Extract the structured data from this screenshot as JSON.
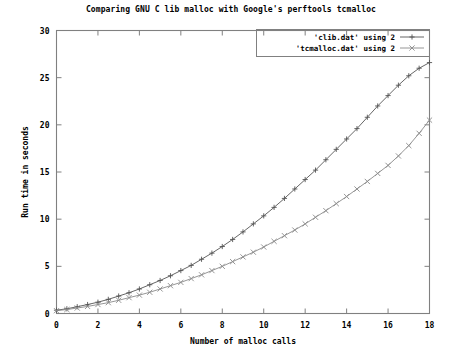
{
  "chart_data": {
    "type": "line",
    "title": "Comparing GNU C lib malloc with Google's perftools tcmalloc",
    "xlabel": "Number of malloc calls",
    "ylabel": "Run time in seconds",
    "xlim": [
      0,
      18
    ],
    "ylim": [
      0,
      30
    ],
    "xticks": [
      0,
      2,
      4,
      6,
      8,
      10,
      12,
      14,
      16,
      18
    ],
    "yticks": [
      0,
      5,
      10,
      15,
      20,
      25,
      30
    ],
    "xtick_labels": [
      "0",
      "2",
      "4",
      "6",
      "8",
      "10",
      "12",
      "14",
      "16",
      "18"
    ],
    "ytick_labels": [
      "0",
      "5",
      "10",
      "15",
      "20",
      "25",
      "30"
    ],
    "grid": false,
    "legend_position": "top-right",
    "x": [
      0,
      0.5,
      1,
      1.5,
      2,
      2.5,
      3,
      3.5,
      4,
      4.5,
      5,
      5.5,
      6,
      6.5,
      7,
      7.5,
      8,
      8.5,
      9,
      9.5,
      10,
      10.5,
      11,
      11.5,
      12,
      12.5,
      13,
      13.5,
      14,
      14.5,
      15,
      15.5,
      16,
      16.5,
      17,
      17.5,
      18
    ],
    "series": [
      {
        "name": "'clib.dat' using 2",
        "marker": "+",
        "color": "#555555",
        "values": [
          0.35,
          0.5,
          0.72,
          0.95,
          1.2,
          1.5,
          1.85,
          2.2,
          2.6,
          3.05,
          3.5,
          4.0,
          4.55,
          5.1,
          5.75,
          6.4,
          7.1,
          7.85,
          8.65,
          9.5,
          10.35,
          11.25,
          12.2,
          13.2,
          14.2,
          15.2,
          16.3,
          17.4,
          18.5,
          19.6,
          20.8,
          22.0,
          23.1,
          24.2,
          25.2,
          26.0,
          26.6
        ]
      },
      {
        "name": "'tcmalloc.dat' using 2",
        "marker": "x",
        "color": "#8a8a8a",
        "values": [
          0.3,
          0.42,
          0.58,
          0.75,
          0.95,
          1.15,
          1.4,
          1.68,
          1.95,
          2.25,
          2.6,
          2.95,
          3.3,
          3.7,
          4.1,
          4.55,
          5.0,
          5.5,
          6.0,
          6.5,
          7.05,
          7.65,
          8.25,
          8.85,
          9.5,
          10.2,
          10.9,
          11.65,
          12.4,
          13.2,
          14.0,
          14.85,
          15.7,
          16.7,
          17.8,
          19.1,
          20.5
        ]
      }
    ]
  },
  "legend": {
    "entries": [
      {
        "label": "'clib.dat' using 2",
        "marker": "+"
      },
      {
        "label": "'tcmalloc.dat' using 2",
        "marker": "x"
      }
    ]
  }
}
